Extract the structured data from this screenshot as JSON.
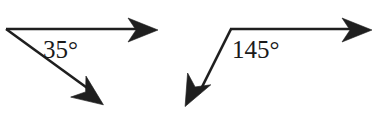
{
  "figure": {
    "type": "geometry-angle-diagram",
    "background_color": "#ffffff",
    "stroke_color": "#1f1f1f",
    "text_color": "#1a1a1a",
    "stroke_width": 2.4,
    "width": 378,
    "height": 118,
    "angles": [
      {
        "id": "left",
        "label": "35°",
        "value": 35,
        "unit": "degrees",
        "vertex": {
          "x": 6,
          "y": 29
        },
        "rays": [
          {
            "name": "horizontal-ray",
            "direction": "right",
            "tip": {
              "x": 158,
              "y": 29
            },
            "arrowhead": true
          },
          {
            "name": "diagonal-ray",
            "direction": "down-right",
            "tip": {
              "x": 104,
              "y": 104
            },
            "arrowhead": true
          }
        ],
        "label_position": {
          "x": 43,
          "y": 37
        }
      },
      {
        "id": "right",
        "label": "145°",
        "value": 145,
        "unit": "degrees",
        "vertex": {
          "x": 231,
          "y": 29
        },
        "rays": [
          {
            "name": "horizontal-ray",
            "direction": "right",
            "tip": {
              "x": 372,
              "y": 29
            },
            "arrowhead": true
          },
          {
            "name": "diagonal-ray",
            "direction": "down-left",
            "tip": {
              "x": 185,
              "y": 107
            },
            "arrowhead": true
          }
        ],
        "label_position": {
          "x": 232,
          "y": 37
        }
      }
    ]
  }
}
